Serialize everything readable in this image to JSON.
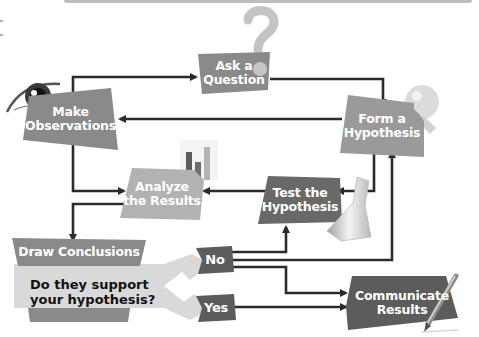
{
  "diagram": {
    "nodes": {
      "ask_question": {
        "lines": [
          "Ask a",
          "Question"
        ]
      },
      "make_observations": {
        "lines": [
          "Make",
          "Observations"
        ]
      },
      "form_hypothesis": {
        "lines": [
          "Form a",
          "Hypothesis"
        ]
      },
      "analyze_results": {
        "lines": [
          "Analyze",
          "the Results"
        ]
      },
      "test_hypothesis": {
        "lines": [
          "Test the",
          "Hypothesis"
        ]
      },
      "draw_conclusions": {
        "label": "Draw Conclusions"
      },
      "question": {
        "lines": [
          "Do they support",
          "your hypothesis?"
        ]
      },
      "no": {
        "label": "No"
      },
      "yes": {
        "label": "Yes"
      },
      "communicate_results": {
        "lines": [
          "Communicate",
          "Results"
        ]
      }
    },
    "edges": [
      {
        "from": "Make Observations",
        "to": "Ask a Question"
      },
      {
        "from": "Ask a Question",
        "to": "Form a Hypothesis"
      },
      {
        "from": "Form a Hypothesis",
        "to": "Make Observations"
      },
      {
        "from": "Form a Hypothesis",
        "to": "Test the Hypothesis"
      },
      {
        "from": "Make Observations",
        "to": "Analyze the Results"
      },
      {
        "from": "Test the Hypothesis",
        "to": "Analyze the Results"
      },
      {
        "from": "Analyze the Results",
        "to": "Draw Conclusions"
      },
      {
        "from": "Draw Conclusions",
        "to": "No"
      },
      {
        "from": "Draw Conclusions",
        "to": "Yes"
      },
      {
        "from": "No",
        "to": "Test the Hypothesis"
      },
      {
        "from": "No",
        "to": "Form a Hypothesis"
      },
      {
        "from": "No",
        "to": "Communicate Results"
      },
      {
        "from": "Yes",
        "to": "Communicate Results"
      }
    ],
    "icons": [
      "question-mark-icon",
      "eye-icon",
      "lightbulb-icon",
      "bar-chart-icon",
      "flask-icon",
      "pencil-icon"
    ],
    "colors": {
      "box_mid": "#8a8a8a",
      "box_dark": "#5c5c5c",
      "box_light": "#a9a9a9",
      "arrow": "#2b2b2b",
      "callout": "#d9d9d9"
    }
  }
}
